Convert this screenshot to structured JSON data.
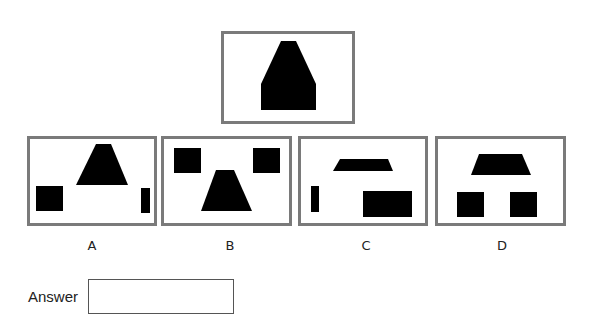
{
  "question": {
    "target": {
      "box": {
        "x": 221,
        "y": 31,
        "w": 134,
        "h": 93
      },
      "shape_points": "281,41 296,41 316,84 316,110 261,110 261,84"
    },
    "options": [
      {
        "label": "A",
        "box": {
          "x": 27,
          "y": 136,
          "w": 130,
          "h": 90
        },
        "label_x": 92,
        "shapes": [
          {
            "type": "polygon",
            "points": "96,144 111,144 128,185 76,185"
          },
          {
            "type": "rect",
            "x": 36,
            "y": 186,
            "w": 27,
            "h": 25
          },
          {
            "type": "rect",
            "x": 141,
            "y": 188,
            "w": 9,
            "h": 25
          }
        ]
      },
      {
        "label": "B",
        "box": {
          "x": 161,
          "y": 136,
          "w": 131,
          "h": 90
        },
        "label_x": 230,
        "shapes": [
          {
            "type": "rect",
            "x": 174,
            "y": 148,
            "w": 27,
            "h": 25
          },
          {
            "type": "rect",
            "x": 253,
            "y": 148,
            "w": 27,
            "h": 25
          },
          {
            "type": "polygon",
            "points": "216,170 234,170 252,211 201,211"
          }
        ]
      },
      {
        "label": "C",
        "box": {
          "x": 298,
          "y": 136,
          "w": 130,
          "h": 90
        },
        "label_x": 366,
        "shapes": [
          {
            "type": "polygon",
            "points": "340,159 388,159 393,171 333,171"
          },
          {
            "type": "rect",
            "x": 311,
            "y": 186,
            "w": 8,
            "h": 26
          },
          {
            "type": "rect",
            "x": 363,
            "y": 191,
            "w": 49,
            "h": 26
          }
        ]
      },
      {
        "label": "D",
        "box": {
          "x": 435,
          "y": 136,
          "w": 131,
          "h": 90
        },
        "label_x": 502,
        "shapes": [
          {
            "type": "polygon",
            "points": "479,154 522,154 531,175 471,175"
          },
          {
            "type": "rect",
            "x": 457,
            "y": 192,
            "w": 27,
            "h": 25
          },
          {
            "type": "rect",
            "x": 510,
            "y": 192,
            "w": 27,
            "h": 25
          }
        ]
      }
    ],
    "label_y": 238
  },
  "answer": {
    "label": "Answer",
    "value": ""
  },
  "colors": {
    "border": "#7a7a7a",
    "shape_fill": "#000000"
  }
}
